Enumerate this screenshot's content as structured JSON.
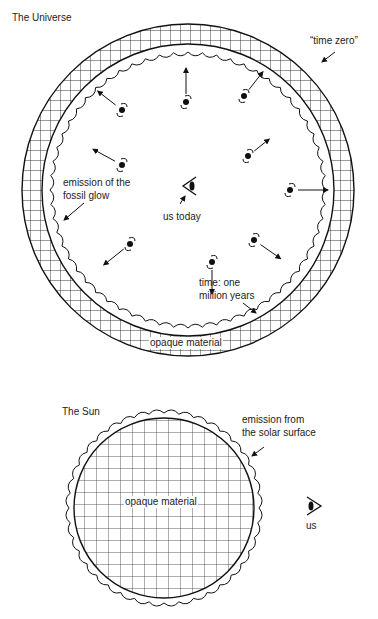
{
  "universe": {
    "title": "The Universe",
    "labels": {
      "time_zero": "“time zero”",
      "fossil_glow_line1": "emission of the",
      "fossil_glow_line2": "fossil glow",
      "us_today": "us today",
      "time_line1": "time: one",
      "time_line2": "million years",
      "opaque": "opaque material"
    },
    "center": [
      188,
      190
    ],
    "outer_radius": 166,
    "inner_radius": 146,
    "scallop_radius": 138,
    "galaxies": [
      {
        "x": 122,
        "y": 165,
        "dx": -22,
        "dy": -12
      },
      {
        "x": 186,
        "y": 102,
        "dx": 0,
        "dy": -26
      },
      {
        "x": 244,
        "y": 96,
        "dx": 14,
        "dy": -18
      },
      {
        "x": 122,
        "y": 110,
        "dx": -18,
        "dy": -14
      },
      {
        "x": 248,
        "y": 156,
        "dx": 15,
        "dy": -12
      },
      {
        "x": 290,
        "y": 190,
        "dx": 30,
        "dy": 0
      },
      {
        "x": 130,
        "y": 244,
        "dx": -20,
        "dy": 16
      },
      {
        "x": 212,
        "y": 262,
        "dx": 0,
        "dy": 24
      },
      {
        "x": 254,
        "y": 240,
        "dx": 20,
        "dy": 14
      }
    ]
  },
  "sun": {
    "title": "The Sun",
    "labels": {
      "emission_line1": "emission from",
      "emission_line2": "the solar surface",
      "opaque": "opaque material",
      "us": "us"
    },
    "center": [
      164,
      508
    ],
    "radius": 90,
    "scallop_radius": 98
  }
}
